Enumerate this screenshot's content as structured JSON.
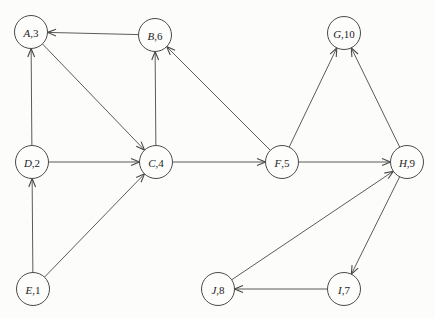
{
  "diagram": {
    "type": "directed-graph",
    "canvas": {
      "width": 435,
      "height": 318,
      "background": "#fcfcfa"
    },
    "style": {
      "edge_color": "#484848",
      "node_outline": "#4a4a4a",
      "node_fill": "#fdfdfc",
      "label_color": "#1c1c1c",
      "node_radius": 16.5
    },
    "nodes": [
      {
        "id": "A",
        "label": "A,3",
        "letter": "A",
        "value": "3",
        "x": 31,
        "y": 32
      },
      {
        "id": "B",
        "label": "B,6",
        "letter": "B",
        "value": "6",
        "x": 155,
        "y": 35
      },
      {
        "id": "G",
        "label": "G,10",
        "letter": "G",
        "value": "10",
        "x": 344,
        "y": 33
      },
      {
        "id": "D",
        "label": "D,2",
        "letter": "D",
        "value": "2",
        "x": 32,
        "y": 162
      },
      {
        "id": "C",
        "label": "C,4",
        "letter": "C",
        "value": "4",
        "x": 156,
        "y": 162
      },
      {
        "id": "F",
        "label": "F,5",
        "letter": "F",
        "value": "5",
        "x": 282,
        "y": 162
      },
      {
        "id": "H",
        "label": "H,9",
        "letter": "H",
        "value": "9",
        "x": 407,
        "y": 162
      },
      {
        "id": "E",
        "label": "E,1",
        "letter": "E",
        "value": "1",
        "x": 33,
        "y": 289
      },
      {
        "id": "J",
        "label": "J,8",
        "letter": "J",
        "value": "8",
        "x": 218,
        "y": 289
      },
      {
        "id": "I",
        "label": "I,7",
        "letter": "I",
        "value": "7",
        "x": 344,
        "y": 289
      }
    ],
    "edges": [
      {
        "from": "B",
        "to": "A"
      },
      {
        "from": "D",
        "to": "A"
      },
      {
        "from": "A",
        "to": "C"
      },
      {
        "from": "C",
        "to": "B"
      },
      {
        "from": "F",
        "to": "B"
      },
      {
        "from": "D",
        "to": "C"
      },
      {
        "from": "E",
        "to": "D"
      },
      {
        "from": "E",
        "to": "C"
      },
      {
        "from": "C",
        "to": "F"
      },
      {
        "from": "F",
        "to": "G"
      },
      {
        "from": "H",
        "to": "G"
      },
      {
        "from": "F",
        "to": "H"
      },
      {
        "from": "J",
        "to": "H"
      },
      {
        "from": "H",
        "to": "I"
      },
      {
        "from": "I",
        "to": "J"
      }
    ]
  }
}
